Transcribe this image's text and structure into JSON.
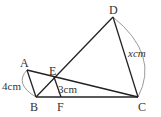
{
  "diagram": {
    "points": {
      "A": {
        "label": "A",
        "x": 27,
        "y": 70
      },
      "B": {
        "label": "B",
        "x": 36,
        "y": 97
      },
      "C": {
        "label": "C",
        "x": 138,
        "y": 97
      },
      "D": {
        "label": "D",
        "x": 113,
        "y": 17
      },
      "E": {
        "label": "E",
        "x": 54,
        "y": 77
      },
      "F": {
        "label": "F",
        "x": 61,
        "y": 97
      }
    },
    "measurements": {
      "AB": "4cm",
      "EF": "3cm",
      "DC": "xcm"
    },
    "colors": {
      "line": "#222222",
      "arc": "#999999",
      "text": "#333333"
    }
  }
}
